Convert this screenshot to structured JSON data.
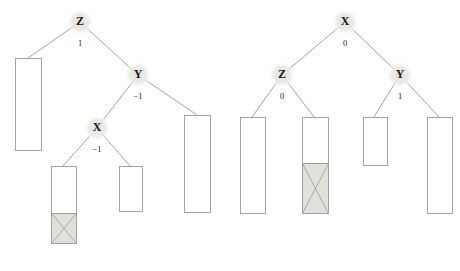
{
  "figure": {
    "title": "",
    "background_color": "#ffffff",
    "node_halo_color": "#ededea",
    "node_text_color": "#1a1a1a",
    "edge_color": "#8a8a8a",
    "bar_outline_color": "#9a9a9a",
    "bar_fill_color": "#ffffff",
    "bar_shaded_fill_color": "#e2e0db"
  },
  "trees": [
    {
      "id": "left-tree",
      "name": "left-decision-tree",
      "root_label": "Z",
      "nodes": [
        {
          "id": "L-Z",
          "label": "Z",
          "cx": 80,
          "cy": 22,
          "r": 14,
          "edge_label": "1",
          "edge_label_x": 80,
          "edge_label_y": 44
        },
        {
          "id": "L-Y",
          "label": "Y",
          "cx": 138,
          "cy": 75,
          "r": 14,
          "edge_label": "-1",
          "edge_label_x": 138,
          "edge_label_y": 97
        },
        {
          "id": "L-X",
          "label": "X",
          "cx": 97,
          "cy": 128,
          "r": 14,
          "edge_label": "-1",
          "edge_label_x": 97,
          "edge_label_y": 150
        }
      ],
      "edges": [
        {
          "id": "L-e1",
          "x1": 80,
          "y1": 22,
          "x2": 28,
          "y2": 58
        },
        {
          "id": "L-e2",
          "x1": 80,
          "y1": 22,
          "x2": 138,
          "y2": 75
        },
        {
          "id": "L-e3",
          "x1": 138,
          "y1": 75,
          "x2": 97,
          "y2": 128
        },
        {
          "id": "L-e4",
          "x1": 138,
          "y1": 75,
          "x2": 197,
          "y2": 115
        },
        {
          "id": "L-e5",
          "x1": 97,
          "y1": 128,
          "x2": 63,
          "y2": 166
        },
        {
          "id": "L-e6",
          "x1": 97,
          "y1": 128,
          "x2": 130,
          "y2": 166
        }
      ],
      "bars": [
        {
          "id": "L-b1",
          "name": "leaf-bar-1",
          "x": 15,
          "y": 58,
          "w": 26,
          "h": 92,
          "shaded_from": null
        },
        {
          "id": "L-b2",
          "name": "leaf-bar-2",
          "x": 51,
          "y": 166,
          "w": 25,
          "h": 77,
          "shaded_from": 213
        },
        {
          "id": "L-b3",
          "name": "leaf-bar-3",
          "x": 119,
          "y": 166,
          "w": 23,
          "h": 45,
          "shaded_from": null
        },
        {
          "id": "L-b4",
          "name": "leaf-bar-4",
          "x": 184,
          "y": 115,
          "w": 26,
          "h": 97,
          "shaded_from": null
        }
      ]
    },
    {
      "id": "right-tree",
      "name": "right-decision-tree",
      "root_label": "X",
      "nodes": [
        {
          "id": "R-X",
          "label": "X",
          "cx": 345,
          "cy": 22,
          "r": 14,
          "edge_label": "0",
          "edge_label_x": 345,
          "edge_label_y": 44
        },
        {
          "id": "R-Z",
          "label": "Z",
          "cx": 282,
          "cy": 75,
          "r": 14,
          "edge_label": "0",
          "edge_label_x": 282,
          "edge_label_y": 97
        },
        {
          "id": "R-Y",
          "label": "Y",
          "cx": 400,
          "cy": 75,
          "r": 14,
          "edge_label": "1",
          "edge_label_x": 400,
          "edge_label_y": 97
        }
      ],
      "edges": [
        {
          "id": "R-e1",
          "x1": 345,
          "y1": 22,
          "x2": 282,
          "y2": 75
        },
        {
          "id": "R-e2",
          "x1": 345,
          "y1": 22,
          "x2": 400,
          "y2": 75
        },
        {
          "id": "R-e3",
          "x1": 282,
          "y1": 75,
          "x2": 252,
          "y2": 117
        },
        {
          "id": "R-e4",
          "x1": 282,
          "y1": 75,
          "x2": 314,
          "y2": 117
        },
        {
          "id": "R-e5",
          "x1": 400,
          "y1": 75,
          "x2": 374,
          "y2": 117
        },
        {
          "id": "R-e6",
          "x1": 400,
          "y1": 75,
          "x2": 439,
          "y2": 117
        }
      ],
      "bars": [
        {
          "id": "R-b1",
          "name": "leaf-bar-5",
          "x": 240,
          "y": 117,
          "w": 25,
          "h": 96,
          "shaded_from": null
        },
        {
          "id": "R-b2",
          "name": "leaf-bar-6",
          "x": 302,
          "y": 117,
          "w": 26,
          "h": 96,
          "shaded_from": 163
        },
        {
          "id": "R-b3",
          "name": "leaf-bar-7",
          "x": 363,
          "y": 117,
          "w": 24,
          "h": 48,
          "shaded_from": null
        },
        {
          "id": "R-b4",
          "name": "leaf-bar-8",
          "x": 427,
          "y": 117,
          "w": 25,
          "h": 96,
          "shaded_from": null
        }
      ]
    }
  ]
}
